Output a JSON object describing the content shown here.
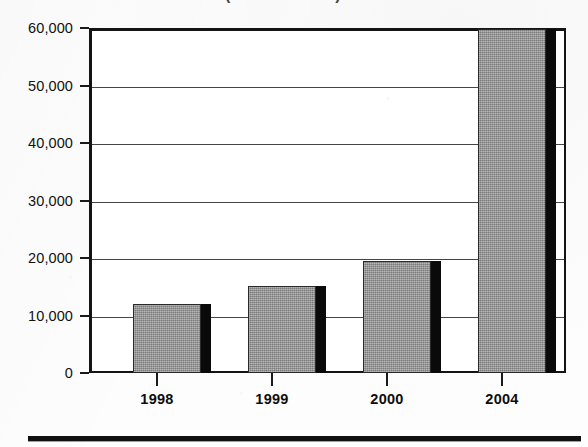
{
  "title": {
    "clipped_text": "(in thousands)",
    "note": "top of figure is cut off by the page crop"
  },
  "footer": {
    "rule": "thick-black-rule"
  },
  "chart_data": {
    "type": "bar",
    "title": "",
    "subtitle": "",
    "xlabel": "",
    "ylabel": "",
    "categories": [
      "1998",
      "1999",
      "2000",
      "2004"
    ],
    "values": [
      11800,
      15300,
      19600,
      60000
    ],
    "series": [
      {
        "name": "",
        "values": [
          11800,
          15300,
          19600,
          60000
        ]
      }
    ],
    "ylim": [
      0,
      60000
    ],
    "yticks": [
      0,
      10000,
      20000,
      30000,
      40000,
      50000,
      60000
    ],
    "ytick_labels": [
      "0",
      "10,000",
      "20,000",
      "30,000",
      "40,000",
      "50,000",
      "60,000"
    ],
    "xtick_labels": [
      "1998",
      "1999",
      "2000",
      "2004"
    ],
    "grid": true,
    "grid_axis": "y",
    "legend": false,
    "legend_position": "none",
    "annotations": [],
    "bar_style": {
      "fill": "#989898",
      "fill_pattern": "dither-halftone-gray",
      "edge": "#2a2a2a",
      "shadow": "#0a0a0a",
      "shadow_offset_px": 10
    },
    "axis_color": "#141414",
    "background": "#ffffff",
    "note": "2004 bar is clipped at the 60,000 axis maximum"
  },
  "geometry": {
    "plot_left": 89,
    "plot_top": 28,
    "plot_width": 477,
    "plot_height": 345,
    "bars": [
      {
        "category": "1998",
        "x": 133,
        "width": 68,
        "shadow_x": 143,
        "top": 303
      },
      {
        "category": "1999",
        "x": 248,
        "width": 68,
        "shadow_x": 258,
        "top": 285
      },
      {
        "category": "2000",
        "x": 363,
        "width": 68,
        "shadow_x": 373,
        "top": 260
      },
      {
        "category": "2004",
        "x": 478,
        "width": 68,
        "shadow_x": 488,
        "top": 28
      }
    ],
    "xtick_positions": [
      157,
      272,
      387,
      502
    ]
  }
}
